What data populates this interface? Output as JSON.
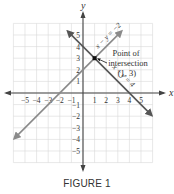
{
  "chart_data": {
    "type": "line",
    "title": "",
    "caption": "FIGURE 1",
    "xlabel": "x",
    "ylabel": "y",
    "xlim": [
      -6,
      6
    ],
    "ylim": [
      -6,
      6
    ],
    "grid": true,
    "x_ticks": [
      -5,
      -4,
      -3,
      -2,
      -1,
      1,
      2,
      3,
      4,
      5
    ],
    "y_ticks": [
      -5,
      -4,
      -3,
      -2,
      -1,
      1,
      2,
      3,
      4,
      5
    ],
    "series": [
      {
        "name": "x − y = −2",
        "equation": "y = x + 2",
        "color": "#888888",
        "points": [
          [
            -5.8,
            -3.8
          ],
          [
            3.2,
            5.2
          ]
        ]
      },
      {
        "name": "x + y = 4",
        "equation": "y = -x + 4",
        "color": "#555555",
        "points": [
          [
            -1.2,
            5.2
          ],
          [
            5.8,
            -1.8
          ]
        ]
      }
    ],
    "annotations": [
      {
        "text": "Point of",
        "x": 1,
        "y": 3
      },
      {
        "text": "intersection",
        "x": 1,
        "y": 3
      },
      {
        "text": "(1, 3)",
        "x": 1,
        "y": 3
      }
    ],
    "highlight_point": {
      "x": 1,
      "y": 3
    }
  },
  "labels": {
    "x_axis": "x",
    "y_axis": "y",
    "line1": "x − y = −2",
    "line2": "x + y = 4",
    "annotation_line1": "Point of",
    "annotation_line2": "intersection",
    "annotation_line3": "(1, 3)",
    "caption": "FIGURE 1"
  },
  "colors": {
    "grid": "#d8d8d8",
    "axis": "#444444",
    "line1": "#8a8a8a",
    "line2": "#555555",
    "point": "#111111"
  }
}
